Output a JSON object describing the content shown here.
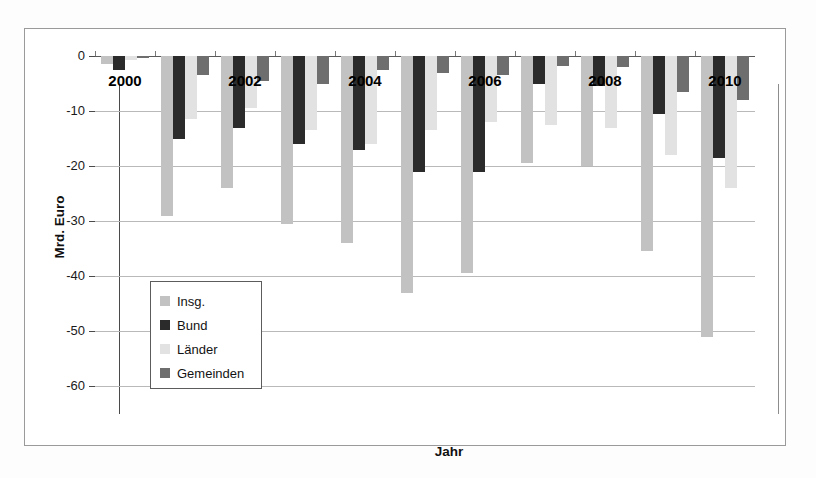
{
  "chart_data": {
    "type": "bar",
    "title": "",
    "xlabel": "Jahr",
    "ylabel": "Mrd. Euro",
    "ylim": [
      -60,
      0
    ],
    "yticks": [
      0,
      -10,
      -20,
      -30,
      -40,
      -50,
      -60
    ],
    "ytick_labels": [
      "0",
      "-10",
      "-20",
      "-30",
      "-40",
      "-50",
      "-60"
    ],
    "grid": true,
    "legend_position": "inside-left",
    "categories": [
      "2000",
      "2001",
      "2002",
      "2003",
      "2004",
      "2005",
      "2006",
      "2007",
      "2008",
      "2009",
      "2010"
    ],
    "visible_tick_labels": [
      "2000",
      "2002",
      "2004",
      "2006",
      "2008",
      "2010"
    ],
    "series": [
      {
        "name": "Insg.",
        "color": "#c2c2c2",
        "values": [
          -1.4,
          -29.0,
          -24.0,
          -30.5,
          -34.0,
          -43.0,
          -39.5,
          -19.5,
          -20.0,
          -35.5,
          -51.0
        ]
      },
      {
        "name": "Bund",
        "color": "#2b2b2b",
        "values": [
          -2.6,
          -15.0,
          -13.0,
          -16.0,
          -17.0,
          -21.0,
          -21.0,
          -5.0,
          -5.5,
          -10.5,
          -18.5
        ]
      },
      {
        "name": "Länder",
        "color": "#e2e2e2",
        "values": [
          -0.8,
          -11.5,
          -9.5,
          -13.5,
          -16.0,
          -13.5,
          -12.0,
          -12.5,
          -13.0,
          -18.0,
          -24.0
        ]
      },
      {
        "name": "Gemeinden",
        "color": "#6e6e6e",
        "values": [
          -0.4,
          -3.5,
          -4.5,
          -5.0,
          -2.5,
          -3.0,
          -3.5,
          -1.8,
          -2.0,
          -6.5,
          -8.0
        ]
      }
    ]
  },
  "legend": {
    "items": [
      {
        "label": "Insg.",
        "color": "#c2c2c2"
      },
      {
        "label": "Bund",
        "color": "#2b2b2b"
      },
      {
        "label": "Länder",
        "color": "#e2e2e2"
      },
      {
        "label": "Gemeinden",
        "color": "#6e6e6e"
      }
    ]
  }
}
